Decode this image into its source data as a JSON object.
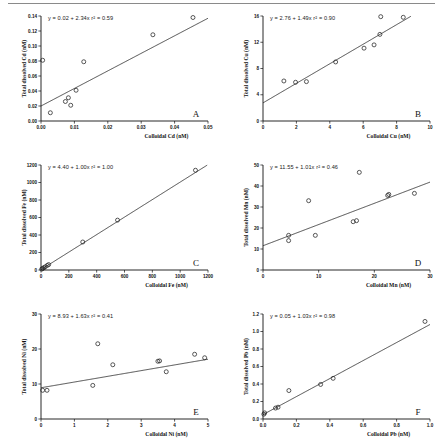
{
  "figure": {
    "panel_count": 6,
    "marker_style": "open-circle",
    "background": "#ffffff",
    "line_color": "#222222"
  },
  "chart_data": [
    {
      "type": "scatter",
      "panel": "A",
      "title": "",
      "xlabel": "Colloidal Cd (nM)",
      "ylabel": "Total dissolved Cd (nM)",
      "annotation": "y = 0.02 + 2.34x  r² = 0.59",
      "slope": 2.34,
      "intercept": 0.02,
      "r2": 0.59,
      "xlim": [
        0.0,
        0.05
      ],
      "ylim": [
        0.0,
        0.14
      ],
      "xticks": [
        "0.00",
        "0.01",
        "0.02",
        "0.03",
        "0.04",
        "0.05"
      ],
      "xtickvals": [
        0.0,
        0.01,
        0.02,
        0.03,
        0.04,
        0.05
      ],
      "yticks": [
        "0.00",
        "0.02",
        "0.04",
        "0.06",
        "0.08",
        "0.10",
        "0.12",
        "0.14"
      ],
      "ytickvals": [
        0.0,
        0.02,
        0.04,
        0.06,
        0.08,
        0.1,
        0.12,
        0.14
      ],
      "grid": false,
      "legend": "none",
      "x": [
        0.0005,
        0.0028,
        0.0073,
        0.0082,
        0.0089,
        0.0105,
        0.0128,
        0.0335,
        0.0455
      ],
      "y": [
        0.081,
        0.011,
        0.026,
        0.031,
        0.021,
        0.041,
        0.079,
        0.115,
        0.138
      ]
    },
    {
      "type": "scatter",
      "panel": "B",
      "title": "",
      "xlabel": "Colloidal Cu (nM)",
      "ylabel": "Total dissolved Cu (nM)",
      "annotation": "y = 2.76 + 1.49x  r² = 0.90",
      "slope": 1.49,
      "intercept": 2.76,
      "r2": 0.9,
      "xlim": [
        0,
        10
      ],
      "ylim": [
        0,
        16
      ],
      "xticks": [
        "0",
        "2",
        "4",
        "6",
        "8",
        "10"
      ],
      "xtickvals": [
        0,
        2,
        4,
        6,
        8,
        10
      ],
      "yticks": [
        "0",
        "4",
        "8",
        "12",
        "16"
      ],
      "ytickvals": [
        0,
        4,
        8,
        12,
        16
      ],
      "grid": false,
      "legend": "none",
      "x": [
        1.25,
        1.95,
        2.6,
        4.35,
        6.05,
        6.65,
        7.0,
        7.05,
        8.4
      ],
      "y": [
        6.1,
        5.9,
        6.0,
        9.0,
        11.1,
        11.6,
        13.2,
        15.9,
        15.8
      ]
    },
    {
      "type": "scatter",
      "panel": "C",
      "title": "",
      "xlabel": "Colloidal Fe (nM)",
      "ylabel": "Total dissolved Fe (nM)",
      "annotation": "y = 4.40 + 1.00x  r² = 1.00",
      "slope": 1.0,
      "intercept": 4.4,
      "r2": 1.0,
      "xlim": [
        0,
        1200
      ],
      "ylim": [
        0,
        1200
      ],
      "xticks": [
        "0",
        "200",
        "400",
        "600",
        "800",
        "1000",
        "1200"
      ],
      "xtickvals": [
        0,
        200,
        400,
        600,
        800,
        1000,
        1200
      ],
      "yticks": [
        "0",
        "200",
        "400",
        "600",
        "800",
        "1000",
        "1200"
      ],
      "ytickvals": [
        0,
        200,
        400,
        600,
        800,
        1000,
        1200
      ],
      "grid": false,
      "legend": "none",
      "x": [
        5,
        12,
        20,
        30,
        45,
        55,
        300,
        550,
        1110
      ],
      "y": [
        10,
        18,
        26,
        36,
        52,
        62,
        320,
        570,
        1140
      ]
    },
    {
      "type": "scatter",
      "panel": "D",
      "title": "",
      "xlabel": "Colloidal Mn (nM)",
      "ylabel": "Total dissolved Mn (nM)",
      "annotation": "y = 11.55 + 1.01x  r² = 0.46",
      "slope": 1.01,
      "intercept": 11.55,
      "r2": 0.46,
      "xlim": [
        0,
        30
      ],
      "ylim": [
        0,
        50
      ],
      "xticks": [
        "0",
        "10",
        "20",
        "30"
      ],
      "xtickvals": [
        0,
        10,
        20,
        30
      ],
      "yticks": [
        "0",
        "10",
        "20",
        "30",
        "40",
        "50"
      ],
      "ytickvals": [
        0,
        10,
        20,
        30,
        40,
        50
      ],
      "grid": false,
      "legend": "none",
      "x": [
        4.6,
        4.6,
        8.2,
        9.4,
        16.2,
        16.8,
        17.3,
        22.4,
        22.6,
        27.2
      ],
      "y": [
        16.5,
        14.0,
        33.0,
        16.5,
        23.0,
        23.5,
        46.5,
        35.5,
        36.0,
        36.5
      ]
    },
    {
      "type": "scatter",
      "panel": "E",
      "title": "",
      "xlabel": "Colloidal Ni (nM)",
      "ylabel": "Total dissolved Ni (nM)",
      "annotation": "y = 8.93 + 1.63x  r² = 0.41",
      "slope": 1.63,
      "intercept": 8.93,
      "r2": 0.41,
      "xlim": [
        0,
        5
      ],
      "ylim": [
        0,
        30
      ],
      "xticks": [
        "0",
        "1",
        "2",
        "3",
        "4",
        "5"
      ],
      "xtickvals": [
        0,
        1,
        2,
        3,
        4,
        5
      ],
      "yticks": [
        "0",
        "10",
        "20",
        "30"
      ],
      "ytickvals": [
        0,
        10,
        20,
        30
      ],
      "grid": false,
      "legend": "none",
      "x": [
        0.05,
        0.18,
        1.55,
        1.7,
        2.15,
        3.5,
        3.55,
        3.75,
        4.6,
        4.9
      ],
      "y": [
        8.2,
        8.2,
        9.6,
        21.5,
        15.5,
        16.5,
        16.6,
        13.5,
        18.5,
        17.5
      ]
    },
    {
      "type": "scatter",
      "panel": "F",
      "title": "",
      "xlabel": "Colloidal Pb (nM)",
      "ylabel": "Total dissolved Pb (nM)",
      "annotation": "y = 0.05 + 1.03x  r² = 0.98",
      "slope": 1.03,
      "intercept": 0.05,
      "r2": 0.98,
      "xlim": [
        0.0,
        1.0
      ],
      "ylim": [
        0.0,
        1.2
      ],
      "xticks": [
        "0.0",
        "0.2",
        "0.4",
        "0.6",
        "0.8",
        "1.0"
      ],
      "xtickvals": [
        0.0,
        0.2,
        0.4,
        0.6,
        0.8,
        1.0
      ],
      "yticks": [
        "0.0",
        "0.2",
        "0.4",
        "0.6",
        "0.8",
        "1.0",
        "1.2"
      ],
      "ytickvals": [
        0.0,
        0.2,
        0.4,
        0.6,
        0.8,
        1.0,
        1.2
      ],
      "grid": false,
      "legend": "none",
      "x": [
        0.005,
        0.01,
        0.075,
        0.09,
        0.155,
        0.345,
        0.42,
        0.97
      ],
      "y": [
        0.055,
        0.07,
        0.125,
        0.135,
        0.325,
        0.395,
        0.465,
        1.115
      ]
    }
  ]
}
